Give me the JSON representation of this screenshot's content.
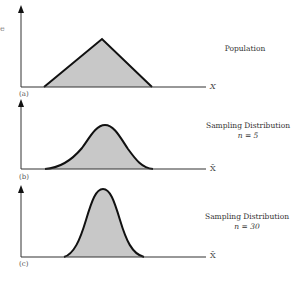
{
  "edge_fragment": "e",
  "panels": [
    {
      "id": "a",
      "label": "(a)",
      "title": "Population",
      "subtitle": "",
      "axis_label": "X",
      "shape": "triangle"
    },
    {
      "id": "b",
      "label": "(b)",
      "title": "Sampling Distribution",
      "subtitle": "n = 5",
      "axis_label": "X̄",
      "shape": "bell-wide"
    },
    {
      "id": "c",
      "label": "(c)",
      "title": "Sampling Distribution",
      "subtitle": "n = 30",
      "axis_label": "X̄",
      "shape": "bell-narrow"
    }
  ],
  "colors": {
    "fill": "#c8c8c8",
    "stroke": "#111111",
    "axis": "#333333"
  }
}
